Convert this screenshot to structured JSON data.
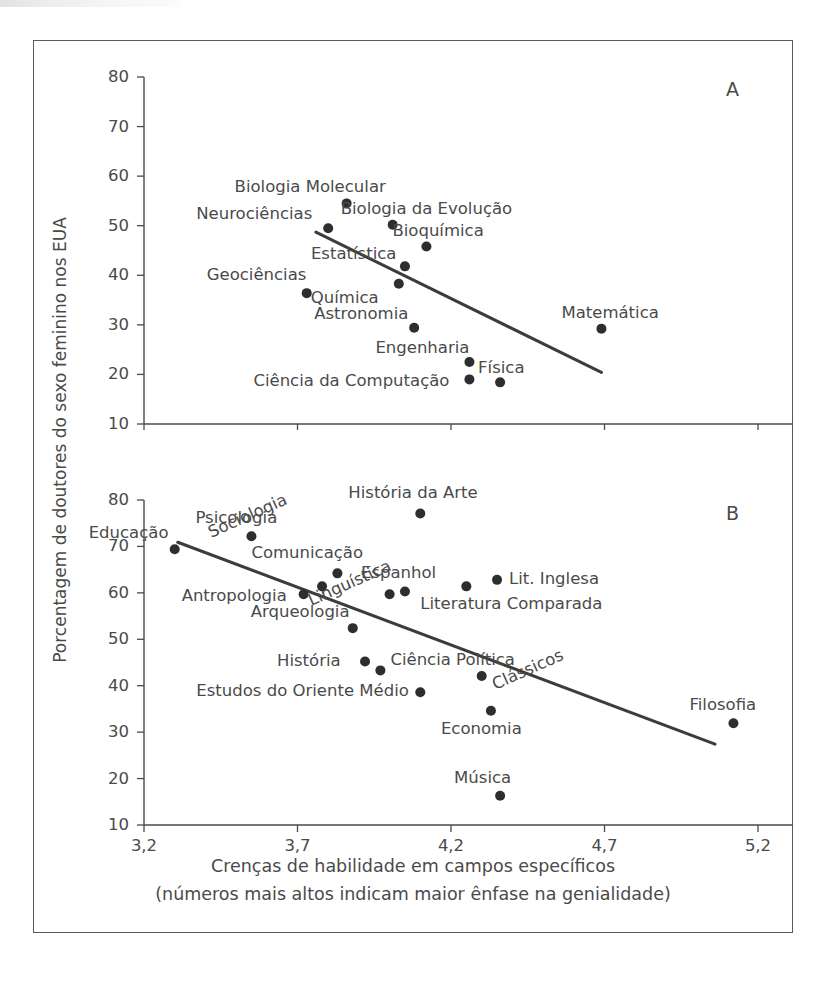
{
  "figure": {
    "y_axis_label": "Porcentagem de doutores do sexo feminino nos EUA",
    "x_axis_caption_line1": "Crenças de habilidade em campos específicos",
    "x_axis_caption_line2": "(números mais altos indicam maior ênfase na genialidade)"
  },
  "chart_data": [
    {
      "type": "scatter",
      "panel": "A",
      "title": "",
      "xlabel": "Crenças de habilidade em campos específicos",
      "ylabel": "Porcentagem de doutores do sexo feminino nos EUA",
      "xlim": [
        3.2,
        5.2
      ],
      "ylim": [
        10,
        80
      ],
      "xticks": [
        "3,2",
        "3,7",
        "4,2",
        "4,7",
        "5,2"
      ],
      "xtickvals": [
        3.2,
        3.7,
        4.2,
        4.7,
        5.2
      ],
      "yticks": [
        "80",
        "70",
        "60",
        "50",
        "40",
        "30",
        "20",
        "10"
      ],
      "ytickvals": [
        80,
        70,
        60,
        50,
        40,
        30,
        20,
        10
      ],
      "grid": false,
      "legend": "none",
      "trendline": {
        "x0": 3.76,
        "y0": 48.7,
        "x1": 4.69,
        "y1": 20.4
      },
      "points": [
        {
          "label": "Biologia Molecular",
          "x": 3.86,
          "y": 54.5,
          "label_dx": -112,
          "label_dy": -24
        },
        {
          "label": "Neurociências",
          "x": 3.8,
          "y": 49.5,
          "label_dx": -132,
          "label_dy": -22
        },
        {
          "label": "Biologia da Evolução",
          "x": 4.01,
          "y": 50.2,
          "label_dx": -52,
          "label_dy": -24
        },
        {
          "label": "Bioquímica",
          "x": 4.12,
          "y": 45.8,
          "label_dx": -34,
          "label_dy": -24
        },
        {
          "label": "Estatística",
          "x": 4.05,
          "y": 41.8,
          "label_dx": -94,
          "label_dy": -20
        },
        {
          "label": "Geociências",
          "x": 3.73,
          "y": 36.4,
          "label_dx": -100,
          "label_dy": -26
        },
        {
          "label": "Química",
          "x": 4.03,
          "y": 38.3,
          "label_dx": -88,
          "label_dy": 6
        },
        {
          "label": "Astronomia",
          "x": 4.08,
          "y": 29.4,
          "label_dx": -100,
          "label_dy": -22
        },
        {
          "label": "Engenharia",
          "x": 4.26,
          "y": 22.5,
          "label_dx": -94,
          "label_dy": -22
        },
        {
          "label": "Ciência da Computação",
          "x": 4.26,
          "y": 19.0,
          "label_dx": -216,
          "label_dy": -6
        },
        {
          "label": "Física",
          "x": 4.36,
          "y": 18.4,
          "label_dx": -22,
          "label_dy": -22
        },
        {
          "label": "Matemática",
          "x": 4.69,
          "y": 29.2,
          "label_dx": -40,
          "label_dy": -24
        }
      ]
    },
    {
      "type": "scatter",
      "panel": "B",
      "title": "",
      "xlabel": "Crenças de habilidade em campos específicos",
      "ylabel": "Porcentagem de doutores do sexo feminino nos EUA",
      "xlim": [
        3.2,
        5.2
      ],
      "ylim": [
        10,
        80
      ],
      "xticks": [
        "3,2",
        "3,7",
        "4,2",
        "4,7",
        "5,2"
      ],
      "xtickvals": [
        3.2,
        3.7,
        4.2,
        4.7,
        5.2
      ],
      "yticks": [
        "80",
        "70",
        "60",
        "50",
        "40",
        "30",
        "20",
        "10"
      ],
      "ytickvals": [
        80,
        70,
        60,
        50,
        40,
        30,
        20,
        10
      ],
      "grid": false,
      "legend": "none",
      "trendline": {
        "x0": 3.31,
        "y0": 70.9,
        "x1": 5.06,
        "y1": 27.4
      },
      "points": [
        {
          "label": "Educação",
          "x": 3.3,
          "y": 69.4,
          "label_dx": -86,
          "label_dy": -24
        },
        {
          "label": "Psicologia",
          "x": 3.55,
          "y": 72.2,
          "label_dx": -56,
          "label_dy": -26
        },
        {
          "label": "História da Arte",
          "x": 4.1,
          "y": 77.1,
          "label_dx": -72,
          "label_dy": -28
        },
        {
          "label": "Sociologia",
          "x": 3.78,
          "y": 61.4,
          "label_dx": -116,
          "label_dy": -60,
          "rot": -24
        },
        {
          "label": "Antropologia",
          "x": 3.72,
          "y": 59.7,
          "label_dx": -122,
          "label_dy": -6
        },
        {
          "label": "Comunicação",
          "x": 3.83,
          "y": 64.2,
          "label_dx": -86,
          "label_dy": -28
        },
        {
          "label": "Linguística",
          "x": 4.0,
          "y": 59.7,
          "label_dx": -84,
          "label_dy": 0,
          "rot": -24
        },
        {
          "label": "Espanhol",
          "x": 4.05,
          "y": 60.3,
          "label_dx": -44,
          "label_dy": -26
        },
        {
          "label": "Arqueologia",
          "x": 3.88,
          "y": 52.4,
          "label_dx": -102,
          "label_dy": -24
        },
        {
          "label": "Literatura Comparada",
          "x": 4.25,
          "y": 61.4,
          "label_dx": -46,
          "label_dy": 10
        },
        {
          "label": "Lit. Inglesa",
          "x": 4.35,
          "y": 62.8,
          "label_dx": 12,
          "label_dy": -9
        },
        {
          "label": "História",
          "x": 3.92,
          "y": 45.2,
          "label_dx": -88,
          "label_dy": -9
        },
        {
          "label": "Ciência Política",
          "x": 3.97,
          "y": 43.3,
          "label_dx": 10,
          "label_dy": -18
        },
        {
          "label": "Estudos do Oriente Médio",
          "x": 4.1,
          "y": 38.6,
          "label_dx": -224,
          "label_dy": -9
        },
        {
          "label": "Clássicos",
          "x": 4.3,
          "y": 42.1,
          "label_dx": 8,
          "label_dy": 2,
          "rot": -24
        },
        {
          "label": "Economia",
          "x": 4.33,
          "y": 34.6,
          "label_dx": -50,
          "label_dy": 10
        },
        {
          "label": "Música",
          "x": 4.36,
          "y": 16.3,
          "label_dx": -46,
          "label_dy": -26
        },
        {
          "label": "Filosofia",
          "x": 5.12,
          "y": 31.9,
          "label_dx": -44,
          "label_dy": -26
        }
      ]
    }
  ],
  "panels": {
    "a_letter": "A",
    "b_letter": "B"
  },
  "colors": {
    "dot": "#2e2e2e",
    "line": "#3c3c3c",
    "axis": "#4a4a4a",
    "frame": "#5a5a5a",
    "text": "#4a4a4a",
    "background": "#ffffff"
  }
}
